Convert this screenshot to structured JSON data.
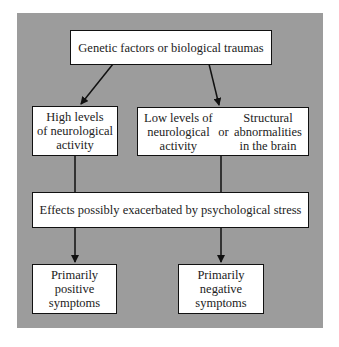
{
  "diagram": {
    "panel_color": "#9c9c9c",
    "nodes": {
      "top": {
        "label": "Genetic factors or biological traumas"
      },
      "high": {
        "label": "High levels\nof neurological\nactivity"
      },
      "low": {
        "label": "Low levels of\nneurological\nactivity"
      },
      "or": {
        "label": "or"
      },
      "structural": {
        "label": "Structural\nabnormalities\nin the brain"
      },
      "effects": {
        "label": "Effects possibly exacerbated by psychological stress"
      },
      "positive": {
        "label": "Primarily\npositive\nsymptoms"
      },
      "negative": {
        "label": "Primarily\nnegative\nsymptoms"
      }
    },
    "edges": [
      {
        "from": "top",
        "to": "high",
        "arrow": true
      },
      {
        "from": "top",
        "to": "low_or_structural",
        "arrow": true
      },
      {
        "from": "high",
        "to": "effects",
        "arrow": false
      },
      {
        "from": "low_or_structural",
        "to": "effects",
        "arrow": false
      },
      {
        "from": "effects",
        "to": "positive",
        "arrow": true
      },
      {
        "from": "effects",
        "to": "negative",
        "arrow": true
      }
    ]
  }
}
